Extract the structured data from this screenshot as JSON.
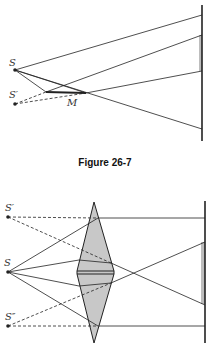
{
  "figure1": {
    "caption": "Figure 26-7",
    "labels": {
      "source": "S",
      "virtual_source": "S′",
      "mirror": "M"
    }
  },
  "figure2": {
    "labels": {
      "virtual_source_top": "S′",
      "source": "S",
      "virtual_source_bottom": "S″"
    }
  },
  "colors": {
    "line": "#222222",
    "prism_fill": "#c8c8c8",
    "background": "#ffffff"
  }
}
